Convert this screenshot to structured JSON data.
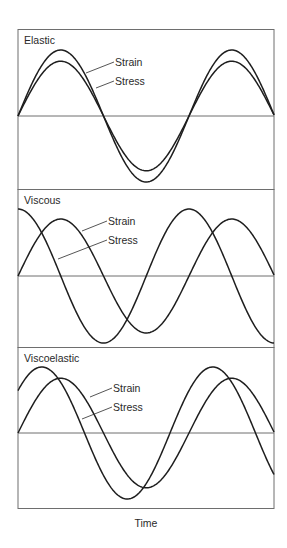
{
  "figure": {
    "x_axis_label": "Time",
    "caption_fragment": "",
    "colors": {
      "curve": "#1e1e1e",
      "frame": "#6e6e6e",
      "text": "#2a2a2a"
    }
  },
  "panels": [
    {
      "title": "Elastic",
      "labels": {
        "strain": "Strain",
        "stress": "Stress"
      }
    },
    {
      "title": "Viscous",
      "labels": {
        "strain": "Strain",
        "stress": "Stress"
      }
    },
    {
      "title": "Viscoelastic",
      "labels": {
        "strain": "Strain",
        "stress": "Stress"
      }
    }
  ],
  "chart_data": [
    {
      "type": "line",
      "title": "Elastic",
      "xlabel": "Time",
      "ylabel": "",
      "x": [
        "0",
        "0.5T",
        "T",
        "1.5T"
      ],
      "series": [
        {
          "name": "Strain",
          "amplitude": 1.0,
          "phase_deg": 0,
          "form": "sine"
        },
        {
          "name": "Stress",
          "amplitude": 0.83,
          "phase_deg": 0,
          "form": "sine"
        }
      ],
      "annotations": [
        "Stress and strain in phase"
      ]
    },
    {
      "type": "line",
      "title": "Viscous",
      "xlabel": "Time",
      "ylabel": "",
      "x": [
        "0",
        "0.5T",
        "T",
        "1.5T"
      ],
      "series": [
        {
          "name": "Strain",
          "amplitude": 0.85,
          "phase_deg": 0,
          "form": "sine"
        },
        {
          "name": "Stress",
          "amplitude": 1.0,
          "phase_deg": 90,
          "form": "sine"
        }
      ],
      "annotations": [
        "Stress leads strain by 90 degrees"
      ]
    },
    {
      "type": "line",
      "title": "Viscoelastic",
      "xlabel": "Time",
      "ylabel": "",
      "x": [
        "0",
        "0.5T",
        "T",
        "1.5T"
      ],
      "series": [
        {
          "name": "Strain",
          "amplitude": 0.83,
          "phase_deg": 0,
          "form": "sine"
        },
        {
          "name": "Stress",
          "amplitude": 1.0,
          "phase_deg": 40,
          "form": "sine"
        }
      ],
      "annotations": [
        "Stress leads strain by 0 to 90 degrees"
      ]
    }
  ]
}
